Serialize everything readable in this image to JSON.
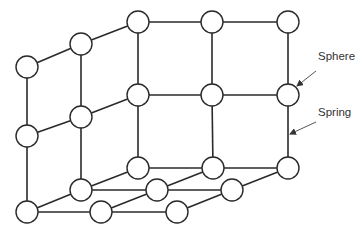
{
  "diagram": {
    "title": "",
    "node_radius": 11,
    "nodes": [
      {
        "id": "t0",
        "x": 27,
        "y": 67
      },
      {
        "id": "t1",
        "x": 81,
        "y": 44
      },
      {
        "id": "t2",
        "x": 138,
        "y": 22
      },
      {
        "id": "t3",
        "x": 212,
        "y": 22
      },
      {
        "id": "t4",
        "x": 288,
        "y": 22
      },
      {
        "id": "m0",
        "x": 27,
        "y": 136
      },
      {
        "id": "m1",
        "x": 81,
        "y": 117
      },
      {
        "id": "m2",
        "x": 138,
        "y": 95
      },
      {
        "id": "m3",
        "x": 212,
        "y": 95
      },
      {
        "id": "m4",
        "x": 288,
        "y": 95
      },
      {
        "id": "a0",
        "x": 138,
        "y": 168
      },
      {
        "id": "a1",
        "x": 213,
        "y": 168
      },
      {
        "id": "a2",
        "x": 288,
        "y": 168
      },
      {
        "id": "b0",
        "x": 81,
        "y": 190
      },
      {
        "id": "b1",
        "x": 157,
        "y": 190
      },
      {
        "id": "b2",
        "x": 232,
        "y": 190
      },
      {
        "id": "c0",
        "x": 27,
        "y": 212
      },
      {
        "id": "c1",
        "x": 101,
        "y": 212
      },
      {
        "id": "c2",
        "x": 177,
        "y": 212
      }
    ],
    "edges": [
      [
        "t0",
        "t1"
      ],
      [
        "t1",
        "t2"
      ],
      [
        "t2",
        "t3"
      ],
      [
        "t3",
        "t4"
      ],
      [
        "m0",
        "m1"
      ],
      [
        "m1",
        "m2"
      ],
      [
        "m2",
        "m3"
      ],
      [
        "m3",
        "m4"
      ],
      [
        "t0",
        "m0"
      ],
      [
        "t1",
        "m1"
      ],
      [
        "t2",
        "m2"
      ],
      [
        "t3",
        "m3"
      ],
      [
        "t4",
        "m4"
      ],
      [
        "m0",
        "c0"
      ],
      [
        "m1",
        "b0"
      ],
      [
        "m2",
        "a0"
      ],
      [
        "m3",
        "a1"
      ],
      [
        "m4",
        "a2"
      ],
      [
        "a0",
        "a1"
      ],
      [
        "a1",
        "a2"
      ],
      [
        "b0",
        "b1"
      ],
      [
        "b1",
        "b2"
      ],
      [
        "c0",
        "c1"
      ],
      [
        "c1",
        "c2"
      ],
      [
        "c0",
        "b0"
      ],
      [
        "b0",
        "a0"
      ],
      [
        "c1",
        "b1"
      ],
      [
        "b1",
        "a1"
      ],
      [
        "c2",
        "b2"
      ],
      [
        "b2",
        "a2"
      ]
    ],
    "annotations": [
      {
        "id": "sphere",
        "text": "Sphere",
        "label_x": 318,
        "label_y": 58,
        "arrow_from": [
          316,
          71
        ],
        "arrow_to": [
          297,
          86
        ]
      },
      {
        "id": "spring",
        "text": "Spring",
        "label_x": 318,
        "label_y": 114,
        "arrow_from": [
          316,
          122
        ],
        "arrow_to": [
          290,
          134
        ]
      }
    ]
  }
}
